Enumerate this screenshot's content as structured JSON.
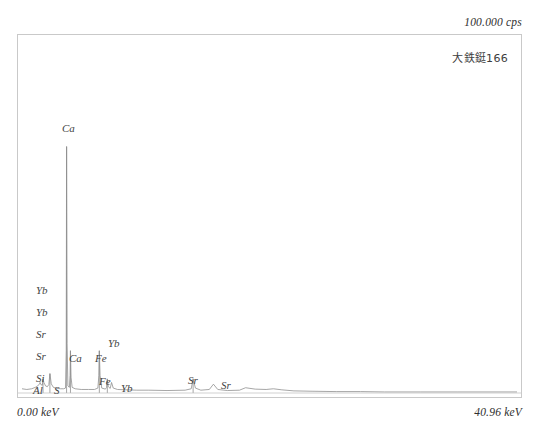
{
  "header": {
    "intensity_label": "100.000 cps",
    "sample_label": "大鉄鋌166"
  },
  "axis": {
    "x_min_label": "0.00 keV",
    "x_max_label": "40.96 keV"
  },
  "colors": {
    "frame": "#c9c9c9",
    "trace": "#8f8f8f",
    "text": "#3a3a3a",
    "background": "#ffffff"
  },
  "peak_labels": [
    {
      "text": "Ca",
      "x": 44,
      "y": 88
    },
    {
      "text": "Yb",
      "x": 18,
      "y": 250
    },
    {
      "text": "Yb",
      "x": 18,
      "y": 272
    },
    {
      "text": "Sr",
      "x": 18,
      "y": 294
    },
    {
      "text": "Sr",
      "x": 18,
      "y": 316
    },
    {
      "text": "Si",
      "x": 18,
      "y": 338
    },
    {
      "text": "Al",
      "x": 15,
      "y": 350
    },
    {
      "text": "S",
      "x": 36,
      "y": 350
    },
    {
      "text": "Ca",
      "x": 51,
      "y": 318
    },
    {
      "text": "Fe",
      "x": 77,
      "y": 318
    },
    {
      "text": "Yb",
      "x": 90,
      "y": 303
    },
    {
      "text": "Fe",
      "x": 81,
      "y": 341
    },
    {
      "text": "Yb",
      "x": 103,
      "y": 348
    },
    {
      "text": "Sr",
      "x": 170,
      "y": 340
    },
    {
      "text": "Sr",
      "x": 203,
      "y": 345
    }
  ],
  "chart_data": {
    "type": "line",
    "title": "大鉄鋌166",
    "xlabel": "keV",
    "ylabel": "cps",
    "xlim": [
      0.0,
      40.96
    ],
    "ylim": [
      0,
      100.0
    ],
    "grid": false,
    "legend": "none",
    "annotations": [
      "100.000 cps",
      "大鉄鋌166",
      "0.00 keV",
      "40.96 keV"
    ],
    "elements_detected": [
      "Al",
      "S",
      "Si",
      "Sr",
      "Yb",
      "Ca",
      "Fe"
    ],
    "peaks": [
      {
        "element": "Al",
        "energy_kev": 1.49,
        "intensity_cps": 3.0
      },
      {
        "element": "Si",
        "energy_kev": 1.74,
        "intensity_cps": 4.0
      },
      {
        "element": "S",
        "energy_kev": 2.31,
        "intensity_cps": 5.5
      },
      {
        "element": "Yb",
        "energy_kev": 1.52,
        "intensity_cps": 2.5
      },
      {
        "element": "Sr",
        "energy_kev": 1.81,
        "intensity_cps": 3.0
      },
      {
        "element": "Ca",
        "energy_kev": 3.69,
        "intensity_cps": 70.0
      },
      {
        "element": "Ca",
        "energy_kev": 4.01,
        "intensity_cps": 12.0
      },
      {
        "element": "Fe",
        "energy_kev": 6.4,
        "intensity_cps": 12.0
      },
      {
        "element": "Fe",
        "energy_kev": 7.06,
        "intensity_cps": 4.0
      },
      {
        "element": "Yb",
        "energy_kev": 7.41,
        "intensity_cps": 3.0
      },
      {
        "element": "Sr",
        "energy_kev": 14.16,
        "intensity_cps": 4.0
      },
      {
        "element": "Sr",
        "energy_kev": 15.84,
        "intensity_cps": 2.5
      },
      {
        "element": "Yb",
        "energy_kev": 18.5,
        "intensity_cps": 1.5
      },
      {
        "element": "Yb",
        "energy_kev": 20.8,
        "intensity_cps": 1.2
      }
    ],
    "series": [
      {
        "name": "spectrum",
        "x": [
          0.0,
          0.4,
          0.8,
          1.1,
          1.3,
          1.45,
          1.49,
          1.56,
          1.68,
          1.74,
          1.81,
          1.95,
          2.1,
          2.22,
          2.31,
          2.42,
          2.6,
          2.9,
          3.2,
          3.45,
          3.6,
          3.66,
          3.69,
          3.73,
          3.8,
          3.92,
          3.98,
          4.01,
          4.06,
          4.15,
          4.4,
          4.9,
          5.5,
          6.0,
          6.28,
          6.36,
          6.4,
          6.46,
          6.6,
          6.9,
          7.0,
          7.06,
          7.14,
          7.3,
          7.41,
          7.55,
          7.9,
          8.6,
          9.5,
          10.5,
          12.0,
          13.5,
          14.0,
          14.16,
          14.35,
          14.8,
          15.5,
          15.84,
          16.2,
          17.0,
          18.0,
          18.5,
          19.3,
          20.2,
          20.8,
          21.5,
          22.5,
          24.0,
          26.0,
          28.0,
          30.0,
          33.0,
          36.0,
          40.96
        ],
        "y": [
          1.2,
          1.0,
          1.2,
          1.6,
          2.0,
          2.6,
          3.0,
          2.4,
          2.2,
          4.0,
          3.0,
          2.0,
          1.8,
          2.4,
          5.5,
          2.6,
          1.6,
          1.3,
          1.2,
          1.2,
          1.4,
          12.0,
          70.0,
          14.0,
          2.0,
          1.6,
          5.0,
          12.0,
          4.5,
          1.6,
          1.2,
          1.0,
          1.0,
          1.0,
          1.4,
          5.0,
          12.0,
          5.0,
          1.4,
          1.1,
          1.6,
          4.0,
          1.8,
          1.3,
          3.0,
          1.4,
          1.0,
          0.9,
          0.8,
          0.8,
          0.7,
          0.8,
          1.2,
          4.0,
          1.4,
          0.8,
          1.0,
          2.5,
          1.0,
          0.7,
          0.8,
          1.5,
          1.1,
          1.0,
          1.2,
          0.9,
          0.6,
          0.5,
          0.4,
          0.4,
          0.3,
          0.3,
          0.3,
          0.3
        ]
      }
    ]
  }
}
